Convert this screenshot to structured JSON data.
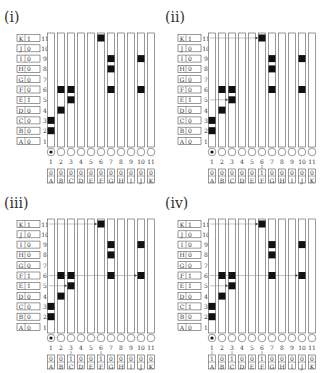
{
  "figure": {
    "row_letters": [
      "A",
      "B",
      "C",
      "D",
      "E",
      "F",
      "G",
      "H",
      "I",
      "J",
      "K"
    ],
    "row_numbers": [
      "1",
      "2",
      "3",
      "4",
      "5",
      "6",
      "7",
      "8",
      "9",
      "10",
      "11"
    ],
    "col_numbers": [
      "1",
      "2",
      "3",
      "4",
      "5",
      "6",
      "7",
      "8",
      "9",
      "10",
      "11"
    ],
    "col_letters": [
      "A",
      "B",
      "C",
      "D",
      "E",
      "F",
      "G",
      "H",
      "I",
      "J",
      "K"
    ],
    "colors": {
      "stroke": "#555555",
      "fill": "#111111",
      "text": "#333333"
    },
    "panels": [
      {
        "label": "(i)",
        "row_values": [
          "0",
          "0",
          "0",
          "0",
          "1",
          "0",
          "0",
          "0",
          "0",
          "0",
          "1"
        ],
        "col_values": [
          "0",
          "0",
          "0",
          "0",
          "0",
          "0",
          "0",
          "0",
          "0",
          "0",
          "0"
        ],
        "markers": [
          [
            1,
            2
          ],
          [
            1,
            3
          ],
          [
            2,
            4
          ],
          [
            2,
            6
          ],
          [
            3,
            5
          ],
          [
            3,
            6
          ],
          [
            6,
            11
          ],
          [
            7,
            6
          ],
          [
            7,
            8
          ],
          [
            7,
            9
          ],
          [
            10,
            6
          ],
          [
            10,
            9
          ]
        ],
        "arrows_rows": [],
        "col_arrows": [],
        "row_arrow_marks": []
      },
      {
        "label": "(ii)",
        "row_values": [
          "0",
          "0",
          "0",
          "0",
          "1",
          "0",
          "0",
          "0",
          "0",
          "0",
          "1"
        ],
        "col_values": [
          "0",
          "0",
          "0",
          "0",
          "0",
          "1",
          "0",
          "0",
          "0",
          "0",
          "0"
        ],
        "markers": [
          [
            1,
            2
          ],
          [
            1,
            3
          ],
          [
            2,
            4
          ],
          [
            2,
            6
          ],
          [
            3,
            5
          ],
          [
            3,
            6
          ],
          [
            6,
            11
          ],
          [
            7,
            6
          ],
          [
            7,
            8
          ],
          [
            7,
            9
          ],
          [
            10,
            6
          ],
          [
            10,
            9
          ]
        ],
        "arrows_rows": [
          [
            11,
            6
          ],
          [
            5,
            3
          ]
        ],
        "col_arrows": [
          6
        ],
        "row_arrow_marks": []
      },
      {
        "label": "(iii)",
        "row_values": [
          "0",
          "0",
          "0",
          "0",
          "1",
          "1",
          "0",
          "0",
          "0",
          "0",
          "1"
        ],
        "col_values": [
          "0",
          "0",
          "1",
          "0",
          "0",
          "1",
          "0",
          "0",
          "0",
          "0",
          "0"
        ],
        "markers": [
          [
            1,
            2
          ],
          [
            1,
            3
          ],
          [
            2,
            4
          ],
          [
            2,
            6
          ],
          [
            3,
            5
          ],
          [
            3,
            6
          ],
          [
            6,
            11
          ],
          [
            7,
            6
          ],
          [
            7,
            8
          ],
          [
            7,
            9
          ],
          [
            10,
            6
          ],
          [
            10,
            9
          ]
        ],
        "arrows_rows": [
          [
            11,
            6
          ],
          [
            5,
            3
          ],
          [
            6,
            10
          ]
        ],
        "col_arrows": [
          3,
          6
        ],
        "row_arrow_marks": []
      },
      {
        "label": "(iv)",
        "row_values": [
          "0",
          "0",
          "1",
          "0",
          "1",
          "1",
          "0",
          "0",
          "0",
          "0",
          "1"
        ],
        "col_values": [
          "1",
          "0",
          "1",
          "0",
          "0",
          "1",
          "0",
          "0",
          "0",
          "0",
          "0"
        ],
        "markers": [
          [
            1,
            2
          ],
          [
            1,
            3
          ],
          [
            2,
            4
          ],
          [
            2,
            6
          ],
          [
            3,
            5
          ],
          [
            3,
            6
          ],
          [
            6,
            11
          ],
          [
            7,
            6
          ],
          [
            7,
            8
          ],
          [
            7,
            9
          ],
          [
            10,
            6
          ],
          [
            10,
            9
          ]
        ],
        "arrows_rows": [
          [
            11,
            6
          ],
          [
            5,
            3
          ],
          [
            6,
            10
          ]
        ],
        "col_arrows": [
          1,
          3,
          6
        ],
        "row_arrow_marks": [
          3
        ]
      }
    ]
  }
}
